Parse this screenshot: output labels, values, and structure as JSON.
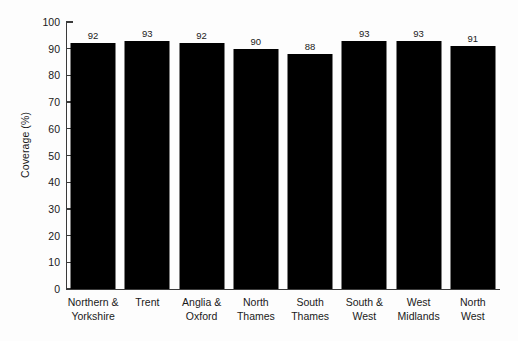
{
  "chart_data": {
    "type": "bar",
    "title": "",
    "subtitle": "",
    "xlabel": "",
    "ylabel": "Coverage (%)",
    "ylim": [
      0,
      100
    ],
    "ytick_step": 10,
    "yticks": [
      "100",
      "90",
      "80",
      "70",
      "60",
      "50",
      "40",
      "30",
      "20",
      "10",
      "0"
    ],
    "grid": false,
    "legend": false,
    "legend_position": "none",
    "bar_color": "#000000",
    "background_color": "#fdfdfd",
    "axis_color": "#3a3a3a",
    "data_labels_shown": true,
    "categories": [
      "Northern & Yorkshire",
      "Trent",
      "Anglia & Oxford",
      "North Thames",
      "South Thames",
      "South & West",
      "West Midlands",
      "North West"
    ],
    "category_lines": [
      [
        "Northern &",
        "Yorkshire"
      ],
      [
        "Trent",
        ""
      ],
      [
        "Anglia &",
        "Oxford"
      ],
      [
        "North",
        "Thames"
      ],
      [
        "South",
        "Thames"
      ],
      [
        "South &",
        "West"
      ],
      [
        "West",
        "Midlands"
      ],
      [
        "North",
        "West"
      ]
    ],
    "values": [
      92,
      93,
      92,
      90,
      88,
      93,
      93,
      91
    ],
    "value_labels": [
      "92",
      "93",
      "92",
      "90",
      "88",
      "93",
      "93",
      "91"
    ]
  }
}
